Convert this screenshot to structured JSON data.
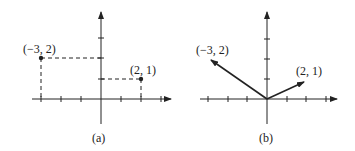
{
  "figures": [
    {
      "id": "a",
      "caption": "(a)",
      "style": "points-with-dashed-projections",
      "points": [
        {
          "label": "(−3, 2)",
          "x": -3,
          "y": 2
        },
        {
          "label": "(2, 1)",
          "x": 2,
          "y": 1
        }
      ]
    },
    {
      "id": "b",
      "caption": "(b)",
      "style": "vectors-from-origin",
      "vectors": [
        {
          "label": "(−3, 2)",
          "x": -3,
          "y": 2
        },
        {
          "label": "(2, 1)",
          "x": 2,
          "y": 1
        }
      ]
    }
  ],
  "colors": {
    "ink": "#222222",
    "background": "#ffffff"
  }
}
